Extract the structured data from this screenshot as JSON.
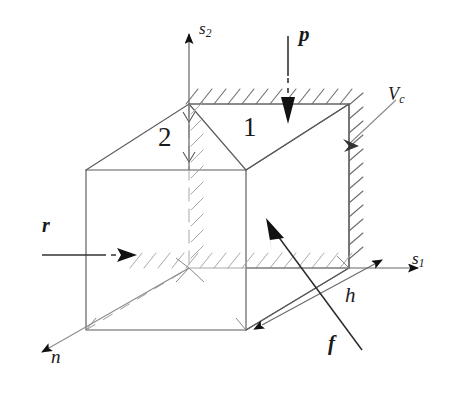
{
  "figure": {
    "type": "engineering-schematic",
    "background_color": "#ffffff",
    "line_color": "#555555",
    "arrow_color": "#111111",
    "text_color": "#1a1a1a"
  },
  "labels": {
    "axis_vertical": {
      "base": "s",
      "sub": "2",
      "text": "s2"
    },
    "axis_horizontal": {
      "base": "s",
      "sub": "1",
      "text": "s1"
    },
    "axis_depth": {
      "base": "n",
      "sub": "",
      "text": "n"
    },
    "load_top": {
      "base": "p",
      "sub": "",
      "text": "p"
    },
    "load_side": {
      "base": "r",
      "sub": "",
      "text": "r"
    },
    "velocity": {
      "base": "V",
      "sub": "c",
      "text": "Vc"
    },
    "dimension": {
      "base": "h",
      "sub": "",
      "text": "h"
    },
    "force": {
      "base": "f",
      "sub": "",
      "text": "f"
    },
    "face_left": "2",
    "face_right": "1"
  },
  "elements": {
    "cube": "wireframe cube drawn in oblique projection",
    "hatching_top": "hatched rigid boundary along top face",
    "hatching_right": "hatched rigid boundary along right face",
    "hatching_interior_vertical": "hatched hidden vertical back edge",
    "hatching_interior_horizontal": "hatched hidden horizontal back edge",
    "diagonal_split": "diagonal line splitting top face into regions 1 and 2"
  }
}
